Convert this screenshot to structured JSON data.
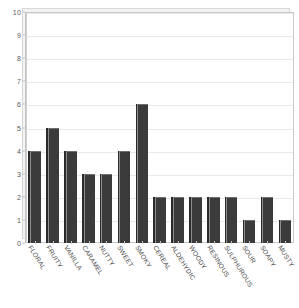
{
  "chart_data": {
    "type": "bar",
    "title": "",
    "xlabel": "",
    "ylabel": "",
    "ylim": [
      0,
      10
    ],
    "ytick_step": 1,
    "yticks": [
      "0",
      "1",
      "2",
      "3",
      "4",
      "5",
      "6",
      "7",
      "8",
      "9",
      "10"
    ],
    "grid": true,
    "legend": false,
    "categories": [
      "FLORAL",
      "FRUITY",
      "VANILLA",
      "CARAMEL",
      "NUTTY",
      "SWEET",
      "SMOKY",
      "CEREAL",
      "ALDEHYDIC",
      "WOODY",
      "RESINOUS",
      "SULPHUROUS",
      "SOUR",
      "SOAPY",
      "MUSTY"
    ],
    "values": [
      4,
      5,
      4,
      3,
      3,
      4,
      6,
      2,
      2,
      2,
      2,
      2,
      1,
      2,
      1
    ],
    "bar_color": "#3b3b3b",
    "plot_background": "#ffffff",
    "grid_color": "#e9e9e9",
    "axis_color": "#c4c4c4"
  }
}
